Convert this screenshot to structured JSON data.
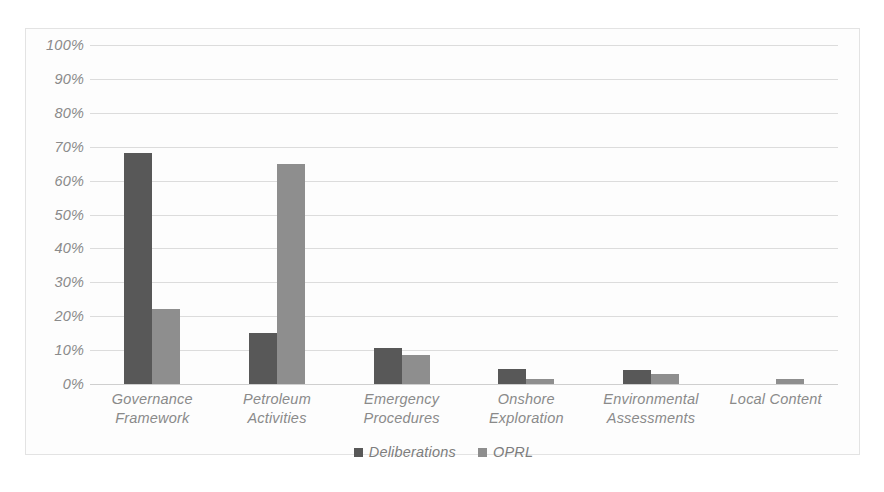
{
  "chart_data": {
    "type": "bar",
    "title": "",
    "subtitle": "",
    "xlabel": "",
    "ylabel": "",
    "ylim": [
      0,
      100
    ],
    "y_tick_labels": [
      "100%",
      "90%",
      "80%",
      "70%",
      "60%",
      "50%",
      "40%",
      "30%",
      "20%",
      "10%",
      "0%"
    ],
    "y_tick_values": [
      100,
      90,
      80,
      70,
      60,
      50,
      40,
      30,
      20,
      10,
      0
    ],
    "grid": true,
    "legend_position": "bottom-center",
    "categories": [
      "Governance Framework",
      "Petroleum Activities",
      "Emergency Procedures",
      "Onshore Exploration",
      "Environmental Assessments",
      "Local Content"
    ],
    "category_label_lines": [
      [
        "Governance",
        "Framework"
      ],
      [
        "Petroleum",
        "Activities"
      ],
      [
        "Emergency",
        "Procedures"
      ],
      [
        "Onshore",
        "Exploration"
      ],
      [
        "Environmental",
        "Assessments"
      ],
      [
        "Local Content"
      ]
    ],
    "series": [
      {
        "name": "Deliberations",
        "color": "#585858",
        "values": [
          68,
          15,
          10.5,
          4.5,
          4,
          0
        ]
      },
      {
        "name": "OPRL",
        "color": "#8e8e8e",
        "values": [
          22,
          65,
          8.5,
          1.5,
          3,
          1.5
        ]
      }
    ]
  },
  "legend": {
    "items": [
      {
        "label": "Deliberations",
        "color": "#585858"
      },
      {
        "label": "OPRL",
        "color": "#8e8e8e"
      }
    ]
  },
  "style": {
    "background": "#fdfdfd",
    "border_color": "#e3e3e3",
    "gridline_color": "#dcdcdc",
    "axis_text_color": "#8a8a8a"
  }
}
